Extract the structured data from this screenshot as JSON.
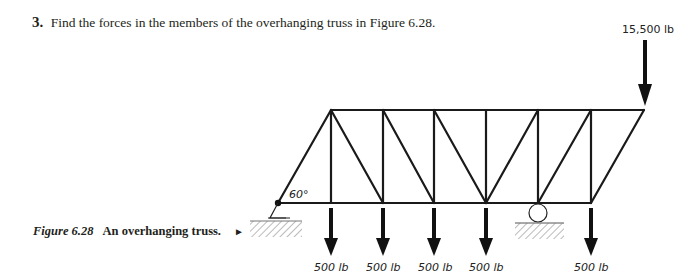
{
  "problem": {
    "number": "3.",
    "text": "Find the forces in the members of the overhanging truss in Figure 6.28."
  },
  "caption": {
    "figure_label": "Figure 6.28",
    "title": "An overhanging truss.",
    "pointer": "►"
  },
  "figure": {
    "angle_label": "60°",
    "top_load": "15,500 lb",
    "bottom_loads": [
      "500 lb",
      "500 lb",
      "500 lb",
      "500 lb",
      "500 lb"
    ],
    "supports": [
      "pin-support",
      "roller-support"
    ]
  }
}
